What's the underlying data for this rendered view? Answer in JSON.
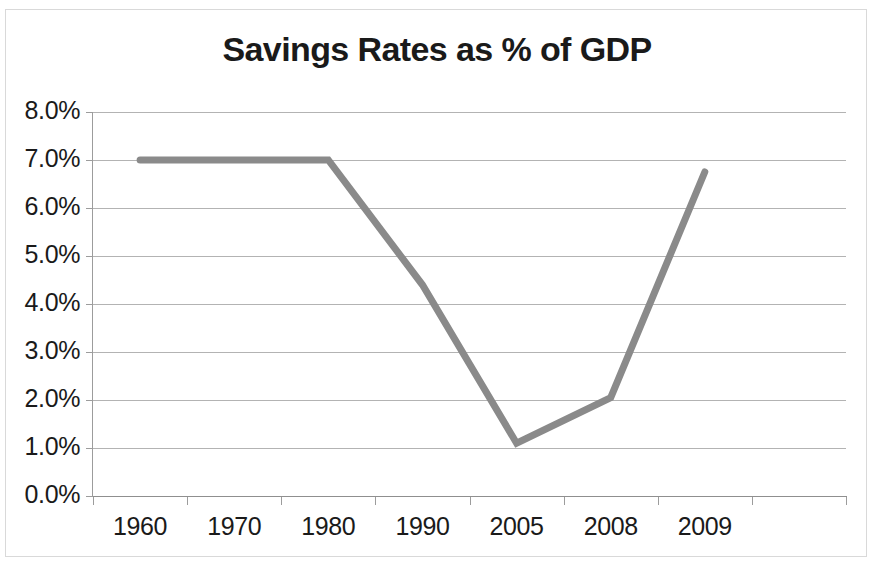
{
  "chart_data": {
    "type": "line",
    "title": "Savings Rates as % of GDP",
    "xlabel": "",
    "ylabel": "",
    "categories": [
      "1960",
      "1970",
      "1980",
      "1990",
      "2005",
      "2008",
      "2009"
    ],
    "series": [
      {
        "name": "Savings Rate",
        "values": [
          7.0,
          7.0,
          7.0,
          4.4,
          1.1,
          2.05,
          6.75
        ],
        "color": "#8a8a8a"
      }
    ],
    "ylim": [
      0,
      8
    ],
    "ytick_values": [
      8.0,
      7.0,
      6.0,
      5.0,
      4.0,
      3.0,
      2.0,
      1.0,
      0.0
    ],
    "ytick_labels": [
      "8.0%",
      "7.0%",
      "6.0%",
      "5.0%",
      "4.0%",
      "3.0%",
      "2.0%",
      "1.0%",
      "0.0%"
    ],
    "grid": true,
    "grid_color": "#b3b3b3",
    "legend": false,
    "legend_position": "none",
    "plot_background": "#ffffff",
    "border_color": "#d9d9d9",
    "axis_color": "#9c9c9c",
    "text_color": "#1a1a1a"
  }
}
